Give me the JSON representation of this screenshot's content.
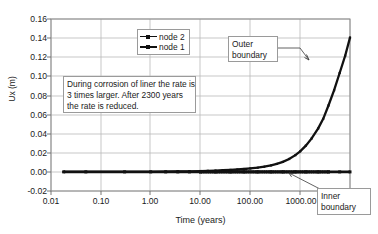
{
  "chart_data": {
    "type": "line",
    "title": "",
    "xlabel": "Time (years)",
    "ylabel": "Ux (m)",
    "xscale": "log",
    "yscale": "linear",
    "xlim": [
      0.01,
      10000
    ],
    "ylim": [
      -0.02,
      0.16
    ],
    "xticks": [
      "0.01",
      "0.10",
      "1.00",
      "10.00",
      "100.00",
      "1000.00"
    ],
    "xtick_values": [
      0.01,
      0.1,
      1,
      10,
      100,
      1000
    ],
    "yticks": [
      "-0.02",
      "0.00",
      "0.02",
      "0.04",
      "0.06",
      "0.08",
      "0.10",
      "0.12",
      "0.14",
      "0.16"
    ],
    "ytick_values": [
      -0.02,
      0.0,
      0.02,
      0.04,
      0.06,
      0.08,
      0.1,
      0.12,
      0.14,
      0.16
    ],
    "grid": "both",
    "legend_position": "upper-center-left",
    "series": [
      {
        "name": "node 2",
        "marker": "small-dot",
        "comment": "outer boundary displacement, rises steeply after ~100 years",
        "x": [
          0.018,
          0.05,
          0.3,
          1.0,
          2.0,
          3.5,
          6.0,
          10.0,
          14.0,
          20.0,
          28.0,
          40.0,
          55.0,
          75.0,
          100.0,
          140.0,
          190.0,
          260.0,
          340.0,
          450.0,
          600.0,
          800.0,
          1000.0,
          1300.0,
          1700.0,
          2300.0,
          2900.0,
          3700.0,
          4800.0,
          6200.0,
          8000.0,
          10000.0
        ],
        "y": [
          0.0,
          0.0,
          0.0,
          0.0,
          0.0002,
          0.0004,
          0.0006,
          0.0009,
          0.0011,
          0.0014,
          0.0017,
          0.0021,
          0.0025,
          0.003,
          0.0036,
          0.0044,
          0.0054,
          0.0068,
          0.0084,
          0.0105,
          0.0135,
          0.0175,
          0.0215,
          0.0275,
          0.035,
          0.0455,
          0.0555,
          0.0695,
          0.0855,
          0.1035,
          0.1215,
          0.1405
        ]
      },
      {
        "name": "node 1",
        "marker": "square",
        "comment": "inner boundary, stays flat at 0.00",
        "x": [
          0.018,
          0.05,
          0.3,
          1.0,
          2.0,
          3.5,
          6.0,
          10.0,
          20.0,
          40.0,
          75.0,
          140.0,
          260.0,
          450.0,
          800.0,
          1300.0,
          2300.0,
          3700.0,
          6200.0,
          10000.0
        ],
        "y": [
          0.0,
          0.0,
          0.0,
          0.0,
          0.0,
          0.0,
          0.0,
          0.0,
          0.0,
          0.0,
          0.0,
          0.0,
          0.0,
          0.0,
          0.0,
          0.0,
          0.0,
          0.0,
          0.0,
          0.0
        ]
      }
    ],
    "annotations": [
      {
        "name": "note",
        "lines": [
          "During corrosion of liner the rate is",
          "3 times larger. After 2300 years",
          "the rate is reduced."
        ]
      },
      {
        "name": "outer-boundary",
        "lines": [
          "Outer",
          "boundary"
        ],
        "points_to": "node 2 curve"
      },
      {
        "name": "inner-boundary",
        "lines": [
          "Inner",
          "boundary"
        ],
        "points_to": "node 1 flat line"
      }
    ]
  },
  "axes": {
    "y_title": "Ux (m)",
    "x_title": "Time (years)",
    "y_tick_labels": [
      "0.16",
      "0.14",
      "0.12",
      "0.10",
      "0.08",
      "0.06",
      "0.04",
      "0.02",
      "0.00",
      "-0.02"
    ],
    "x_tick_labels": [
      "0.01",
      "0.10",
      "1.00",
      "10.00",
      "100.00",
      "1000.00"
    ]
  },
  "legend": {
    "items": [
      {
        "label": "node 2"
      },
      {
        "label": "node 1"
      }
    ]
  },
  "notes": {
    "body_line1": "During corrosion of liner the rate is",
    "body_line2": "3 times larger. After 2300 years",
    "body_line3": "the rate is reduced.",
    "outer_line1": "Outer",
    "outer_line2": "boundary",
    "inner_line1": "Inner",
    "inner_line2": "boundary"
  },
  "colors": {
    "line": "#111111",
    "grid": "#b9b9b9",
    "frame": "#8a8a8a",
    "text": "#1a1a1a",
    "background": "#ffffff"
  }
}
